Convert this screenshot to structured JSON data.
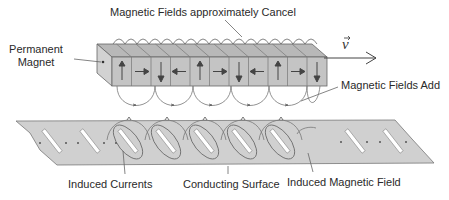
{
  "labels": {
    "top": "Magnetic Fields approximately Cancel",
    "permanent_magnet_line1": "Permanent",
    "permanent_magnet_line2": "Magnet",
    "velocity": "v",
    "fields_add": "Magnetic Fields Add",
    "induced_currents": "Induced Currents",
    "conducting_surface": "Conducting Surface",
    "induced_magnetic_field": "Induced Magnetic Field"
  },
  "magnet": {
    "segment_count": 11,
    "segments": [
      "up",
      "right",
      "down",
      "left",
      "up",
      "right",
      "down",
      "left",
      "up",
      "right",
      "down"
    ]
  },
  "colors": {
    "magnet_front": "#c4c4c4",
    "magnet_top": "#b8b8b8",
    "magnet_side": "#d2d2d2",
    "surface": "#d0d0d0",
    "line": "#555555",
    "slot": "#ffffff"
  }
}
